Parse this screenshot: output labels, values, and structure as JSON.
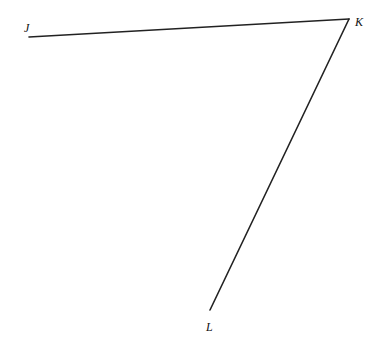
{
  "diagram": {
    "type": "angle",
    "points": [
      {
        "id": "J",
        "label": "J",
        "x": 29,
        "y": 37,
        "label_x": 24,
        "label_y": 32
      },
      {
        "id": "K",
        "label": "K",
        "x": 349,
        "y": 19,
        "label_x": 355,
        "label_y": 26
      },
      {
        "id": "L",
        "label": "L",
        "x": 210,
        "y": 310,
        "label_x": 206,
        "label_y": 331
      }
    ],
    "segments": [
      {
        "id": "KJ",
        "from": "K",
        "to": "J"
      },
      {
        "id": "KL",
        "from": "K",
        "to": "L"
      }
    ],
    "colors": {
      "line": "#222222",
      "label": "#111111",
      "background": "#ffffff"
    }
  }
}
